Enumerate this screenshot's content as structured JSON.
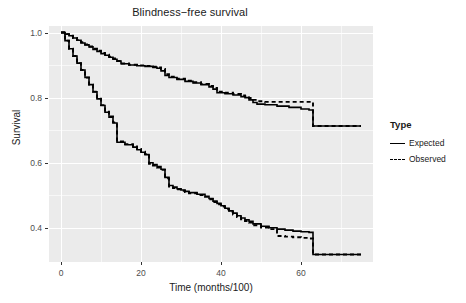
{
  "chart_data": {
    "type": "line",
    "title": "Blindness−free survival",
    "xlabel": "Time (months/100)",
    "ylabel": "Survival",
    "xlim": [
      -3,
      78
    ],
    "ylim": [
      0.295,
      1.02
    ],
    "xticks": [
      0,
      20,
      40,
      60
    ],
    "xtick_labels": [
      "0",
      "20",
      "40",
      "60"
    ],
    "yticks": [
      0.4,
      0.6,
      0.8,
      1.0
    ],
    "ytick_labels": [
      "0.4",
      "0.6",
      "0.8",
      "1.0"
    ],
    "grid": true,
    "legend_position": "right",
    "legend_title": "Type",
    "panel_background": "#ebebeb",
    "grid_color": "#ffffff",
    "series": [
      {
        "name": "Expected",
        "style": "solid",
        "color": "#000000",
        "group": "upper",
        "x": [
          0,
          1,
          2,
          3,
          4,
          5,
          6,
          7,
          8,
          9,
          10,
          11,
          12,
          13,
          14,
          15,
          17,
          19,
          21,
          23,
          24,
          25,
          26,
          27,
          29,
          31,
          33,
          35,
          37,
          38,
          39,
          41,
          43,
          45,
          46,
          47,
          48,
          49,
          51,
          54,
          57,
          60,
          62,
          63,
          66,
          70,
          75
        ],
        "y": [
          1.0,
          0.995,
          0.99,
          0.983,
          0.976,
          0.968,
          0.962,
          0.956,
          0.948,
          0.942,
          0.935,
          0.93,
          0.924,
          0.918,
          0.912,
          0.904,
          0.9,
          0.898,
          0.896,
          0.893,
          0.89,
          0.882,
          0.868,
          0.862,
          0.856,
          0.85,
          0.845,
          0.84,
          0.833,
          0.826,
          0.815,
          0.812,
          0.808,
          0.803,
          0.8,
          0.793,
          0.785,
          0.78,
          0.778,
          0.774,
          0.77,
          0.765,
          0.762,
          0.713,
          0.713,
          0.713,
          0.713
        ]
      },
      {
        "name": "Observed",
        "style": "dashed",
        "color": "#000000",
        "group": "upper",
        "x": [
          0,
          1,
          2,
          3,
          4,
          5,
          6,
          7,
          8,
          9,
          10,
          11,
          12,
          13,
          14,
          15,
          17,
          19,
          21,
          23,
          24,
          25,
          26,
          27,
          29,
          31,
          33,
          35,
          37,
          38,
          39,
          41,
          43,
          45,
          46,
          47,
          48,
          49,
          51,
          54,
          57,
          60,
          62,
          63,
          66,
          70,
          75
        ],
        "y": [
          1.0,
          0.995,
          0.99,
          0.983,
          0.977,
          0.97,
          0.963,
          0.957,
          0.95,
          0.944,
          0.937,
          0.932,
          0.926,
          0.92,
          0.913,
          0.905,
          0.901,
          0.899,
          0.897,
          0.895,
          0.893,
          0.888,
          0.872,
          0.864,
          0.858,
          0.852,
          0.847,
          0.842,
          0.836,
          0.83,
          0.818,
          0.815,
          0.811,
          0.807,
          0.804,
          0.799,
          0.793,
          0.789,
          0.787,
          0.787,
          0.787,
          0.787,
          0.787,
          0.713,
          0.713,
          0.713,
          0.713
        ]
      },
      {
        "name": "Expected",
        "style": "solid",
        "color": "#000000",
        "group": "lower",
        "x": [
          0,
          1,
          2,
          3,
          4,
          5,
          6,
          7,
          8,
          9,
          10,
          11,
          12,
          13,
          14,
          16,
          18,
          19,
          20,
          21,
          22,
          23,
          24,
          25,
          26,
          27,
          28,
          29,
          30,
          31,
          32,
          34,
          36,
          37,
          38,
          39,
          40,
          41,
          42,
          43,
          44,
          45,
          46,
          47,
          48,
          50,
          52,
          54,
          56,
          58,
          60,
          62,
          63,
          66,
          70,
          75
        ],
        "y": [
          1.0,
          0.975,
          0.95,
          0.928,
          0.906,
          0.885,
          0.862,
          0.84,
          0.818,
          0.796,
          0.776,
          0.755,
          0.74,
          0.722,
          0.663,
          0.655,
          0.648,
          0.64,
          0.632,
          0.625,
          0.6,
          0.594,
          0.588,
          0.58,
          0.555,
          0.53,
          0.525,
          0.52,
          0.516,
          0.512,
          0.508,
          0.503,
          0.497,
          0.49,
          0.482,
          0.475,
          0.468,
          0.46,
          0.452,
          0.445,
          0.437,
          0.43,
          0.425,
          0.42,
          0.412,
          0.405,
          0.4,
          0.396,
          0.393,
          0.39,
          0.388,
          0.386,
          0.318,
          0.318,
          0.318,
          0.318
        ]
      },
      {
        "name": "Observed",
        "style": "dashed",
        "color": "#000000",
        "group": "lower",
        "x": [
          0,
          1,
          2,
          3,
          4,
          5,
          6,
          7,
          8,
          9,
          10,
          11,
          12,
          13,
          14,
          16,
          18,
          19,
          20,
          21,
          22,
          23,
          24,
          25,
          26,
          27,
          28,
          29,
          30,
          31,
          32,
          34,
          36,
          37,
          38,
          39,
          40,
          41,
          42,
          43,
          44,
          45,
          46,
          47,
          48,
          50,
          52,
          54,
          56,
          58,
          60,
          62,
          63,
          66,
          70,
          75
        ],
        "y": [
          1.0,
          0.975,
          0.95,
          0.928,
          0.906,
          0.885,
          0.862,
          0.84,
          0.818,
          0.797,
          0.777,
          0.757,
          0.742,
          0.724,
          0.665,
          0.657,
          0.65,
          0.642,
          0.634,
          0.627,
          0.597,
          0.591,
          0.585,
          0.578,
          0.552,
          0.527,
          0.522,
          0.518,
          0.514,
          0.51,
          0.506,
          0.501,
          0.495,
          0.488,
          0.479,
          0.472,
          0.465,
          0.457,
          0.449,
          0.441,
          0.433,
          0.426,
          0.421,
          0.416,
          0.408,
          0.401,
          0.396,
          0.375,
          0.373,
          0.371,
          0.369,
          0.367,
          0.318,
          0.318,
          0.318,
          0.318
        ]
      }
    ],
    "legend_entries": [
      {
        "label": "Expected",
        "style": "solid"
      },
      {
        "label": "Observed",
        "style": "dashed"
      }
    ]
  }
}
